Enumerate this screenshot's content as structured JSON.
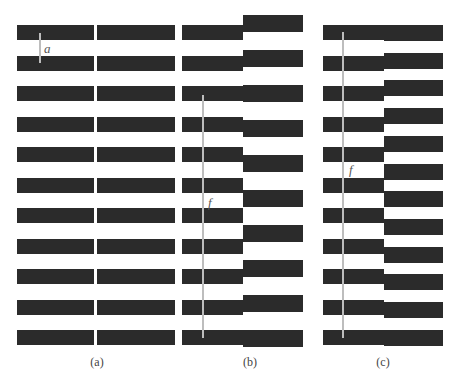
{
  "panels": {
    "a": {
      "caption": "(a)",
      "dimension_label": "a",
      "bar_color": "#2b2b2b",
      "left_column": {
        "x": 17,
        "width": 77,
        "bar_height": 15,
        "first_y": 25,
        "spacing": 30.5,
        "count": 11
      },
      "right_column": {
        "x": 97,
        "width": 78,
        "bar_height": 15,
        "first_y": 25,
        "spacing": 30.5,
        "count": 11
      },
      "line": {
        "x": 39,
        "y1": 33,
        "y2": 63
      },
      "label_pos": {
        "x": 44,
        "y": 42
      },
      "caption_pos": {
        "x": 97,
        "y": 356
      }
    },
    "b": {
      "caption": "(b)",
      "dimension_label": "f",
      "bar_color": "#2b2b2b",
      "left_column": {
        "x": 182,
        "width": 61,
        "bar_height": 15,
        "first_y": 25,
        "spacing": 30.5,
        "count": 11
      },
      "right_column": {
        "x": 243,
        "width": 60,
        "bar_height": 17,
        "first_y": 15,
        "spacing": 35,
        "count": 10
      },
      "line": {
        "x": 202,
        "y1": 95,
        "y2": 338
      },
      "label_pos": {
        "x": 208,
        "y": 196
      },
      "caption_pos": {
        "x": 250,
        "y": 356
      }
    },
    "c": {
      "caption": "(c)",
      "dimension_label": "f",
      "bar_color": "#2b2b2b",
      "left_column": {
        "x": 323,
        "width": 61,
        "bar_height": 15,
        "first_y": 25,
        "spacing": 30.5,
        "count": 11
      },
      "right_column": {
        "x": 384,
        "width": 59,
        "bar_height": 16,
        "first_y": 25,
        "spacing": 27.7,
        "count": 12
      },
      "line": {
        "x": 342,
        "y1": 32,
        "y2": 338
      },
      "label_pos": {
        "x": 349,
        "y": 163
      },
      "caption_pos": {
        "x": 383,
        "y": 356
      }
    }
  },
  "line_color": "#bdbdbd"
}
